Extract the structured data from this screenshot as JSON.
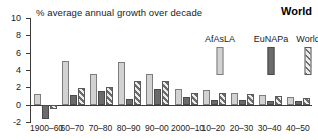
{
  "chart_data": {
    "type": "bar",
    "title": "World",
    "subtitle": "% average annual growth over decade",
    "xlabel": "",
    "ylabel": "",
    "ylim": [
      -2,
      10
    ],
    "yticks": [
      -2,
      0,
      2,
      4,
      6,
      8,
      10
    ],
    "ytick_labels": [
      "-2",
      "0",
      "2",
      "4",
      "6",
      "8",
      "10"
    ],
    "grid": false,
    "legend_position": "top-right",
    "categories": [
      "1900–60",
      "60–70",
      "70–80",
      "80–90",
      "90–00",
      "2000–10",
      "10–20",
      "20–30",
      "30–40",
      "40–50"
    ],
    "series": [
      {
        "name": "AfAsLA",
        "color": "#d2d2d2",
        "pattern": "solid-light",
        "values": [
          1.2,
          5.0,
          3.5,
          4.9,
          3.5,
          1.8,
          1.65,
          1.4,
          1.1,
          0.85
        ]
      },
      {
        "name": "EuNAPa",
        "color": "#6b6b6b",
        "pattern": "solid-dark",
        "values": [
          -1.6,
          1.1,
          1.6,
          0.6,
          1.85,
          0.85,
          0.5,
          0.55,
          0.45,
          0.4
        ]
      },
      {
        "name": "World",
        "color": "#6b6b6b",
        "pattern": "diagonal-hatch",
        "values": [
          -0.5,
          1.9,
          2.0,
          2.7,
          2.75,
          1.4,
          1.3,
          1.25,
          1.0,
          0.8
        ]
      }
    ]
  },
  "legend": {
    "items": [
      {
        "label": "AfAsLA"
      },
      {
        "label": "EuNAPa"
      },
      {
        "label": "World"
      }
    ]
  }
}
